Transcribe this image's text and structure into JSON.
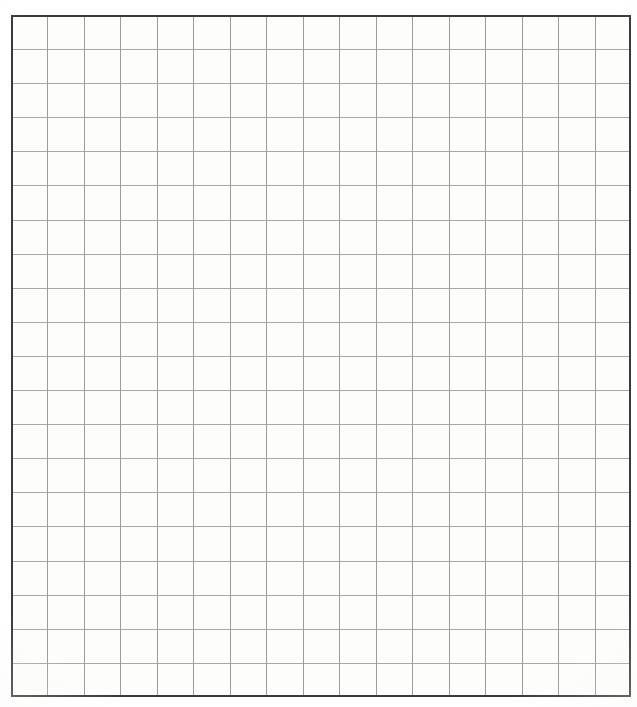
{
  "document": {
    "kind": "grid-paper-scan",
    "title": "Blank square grid paper",
    "page_width_px": 637,
    "page_height_px": 707,
    "background_color": "#ffffff",
    "paper_color": "#fdfdfc",
    "has_text": false,
    "has_handwriting": false,
    "content_note": ""
  },
  "grid": {
    "columns": 17,
    "rows": 20,
    "origin_x_px": 11,
    "origin_y_px": 15,
    "width_px": 620,
    "height_px": 682,
    "cell_width_px": 36.47,
    "cell_height_px": 34.1,
    "line_color_vertical": "#9c9c9c",
    "line_color_horizontal": "#a8a8a8",
    "line_width_px": 1,
    "border_color": "#3a3a3a",
    "border_width_px": 2
  },
  "margins": {
    "left_px": 11,
    "top_px": 15,
    "right_px": 6,
    "bottom_px": 10
  }
}
